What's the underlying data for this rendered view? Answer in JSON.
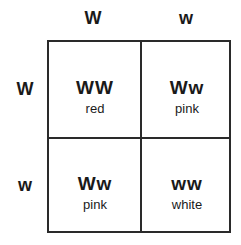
{
  "columns": [
    {
      "allele": "W"
    },
    {
      "allele": "w"
    }
  ],
  "rows": [
    {
      "allele": "W"
    },
    {
      "allele": "w"
    }
  ],
  "cells": [
    [
      {
        "genotype": "WW",
        "phenotype": "red"
      },
      {
        "genotype": "Ww",
        "phenotype": "pink"
      }
    ],
    [
      {
        "genotype": "Ww",
        "phenotype": "pink"
      },
      {
        "genotype": "ww",
        "phenotype": "white"
      }
    ]
  ]
}
